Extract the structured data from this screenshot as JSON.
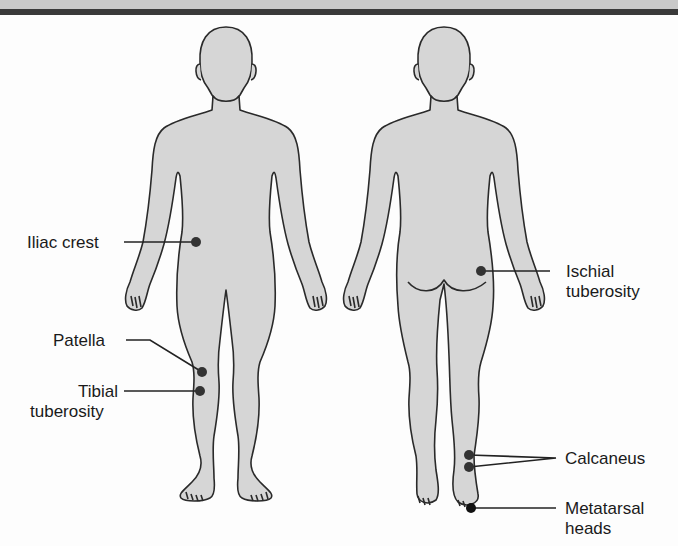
{
  "figure": {
    "views": [
      "anterior",
      "posterior"
    ],
    "colors": {
      "body_fill": "#d6d6d6",
      "outline": "#2a2a2a",
      "marker": "#333333",
      "header_band": "#c9c9c9",
      "header_rule": "#3a3a3a"
    }
  },
  "labels": {
    "iliac_crest": "Iliac crest",
    "patella": "Patella",
    "tibial_line1": "Tibial",
    "tibial_line2": "tuberosity",
    "ischial_line1": "Ischial",
    "ischial_line2": "tuberosity",
    "calcaneus": "Calcaneus",
    "metatarsal_line1": "Metatarsal",
    "metatarsal_line2": "heads"
  }
}
